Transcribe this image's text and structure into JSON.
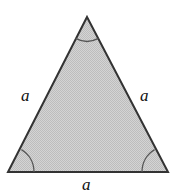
{
  "figure": {
    "kind": "equilateral-triangle-diagram",
    "width": 182,
    "height": 195,
    "background_color": "#ffffff",
    "shape": {
      "name": "equilateral triangle",
      "fill_color": "#c8c8c8",
      "fill_style": "stippled-gray",
      "stroke_color": "#333333",
      "stroke_width": 2,
      "vertices": {
        "apex": {
          "x": 87,
          "y": 17
        },
        "bottom_left": {
          "x": 8,
          "y": 172
        },
        "bottom_right": {
          "x": 168,
          "y": 172
        }
      }
    },
    "angle_arcs": [
      {
        "at": "apex",
        "radius": 24,
        "stroke_color": "#555555"
      },
      {
        "at": "bottom-left",
        "radius": 26,
        "stroke_color": "#555555"
      },
      {
        "at": "bottom-right",
        "radius": 26,
        "stroke_color": "#555555"
      }
    ],
    "labels": {
      "left_side": "a",
      "right_side": "a",
      "bottom_side": "a"
    },
    "clipped_caption": {
      "left_fragment": "l",
      "right_fragment": "g"
    }
  }
}
